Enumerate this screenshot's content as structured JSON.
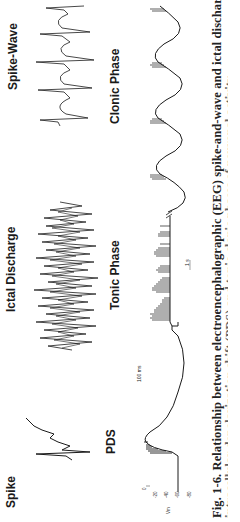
{
  "figure": {
    "orientation": "rotated-90-ccw",
    "panels": {
      "spike": {
        "label": "Spike"
      },
      "pds": {
        "label": "PDS"
      },
      "ictal_discharge": {
        "label": "Ictal Discharge"
      },
      "tonic_phase": {
        "label": "Tonic Phase"
      },
      "spike_wave": {
        "label": "Spike-Wave"
      },
      "clonic_phase": {
        "label": "Clonic Phase"
      }
    },
    "axis": {
      "label": "Vm",
      "ticks": [
        "0",
        "-20",
        "-40",
        "-60",
        "-80"
      ]
    },
    "scale_bars": {
      "short": "100 ms",
      "long": "1 s"
    },
    "caption": {
      "line1": "Fig. 1-6.  Relationship between electroencephalographic (EEG) spike-and-wave and ictal discharge and",
      "line2": "intracellular depolarization shift (PDS) and tonic-clonic phases of neuronal activity"
    }
  }
}
